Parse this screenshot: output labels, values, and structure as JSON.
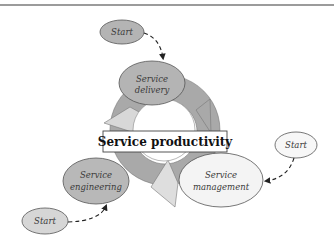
{
  "diagram": {
    "title": "Service productivity",
    "nodes": {
      "delivery": {
        "line1": "Service",
        "line2": "delivery"
      },
      "engineering": {
        "line1": "Service",
        "line2": "engineering"
      },
      "management": {
        "line1": "Service",
        "line2": "management"
      },
      "start_top": {
        "label": "Start"
      },
      "start_right": {
        "label": "Start"
      },
      "start_bottom": {
        "label": "Start"
      }
    },
    "edges": [
      {
        "from": "start_top",
        "to": "delivery",
        "style": "dashed"
      },
      {
        "from": "start_right",
        "to": "management",
        "style": "dashed"
      },
      {
        "from": "start_bottom",
        "to": "engineering",
        "style": "dashed"
      }
    ],
    "cycle": [
      "delivery",
      "management",
      "engineering"
    ],
    "colors": {
      "dark_fill": "#b4b4b4",
      "ring_fill": "#a9a9a9",
      "light_fill": "#d6d6d6",
      "white_fill": "#f7f7f7",
      "stroke": "#555555"
    }
  }
}
